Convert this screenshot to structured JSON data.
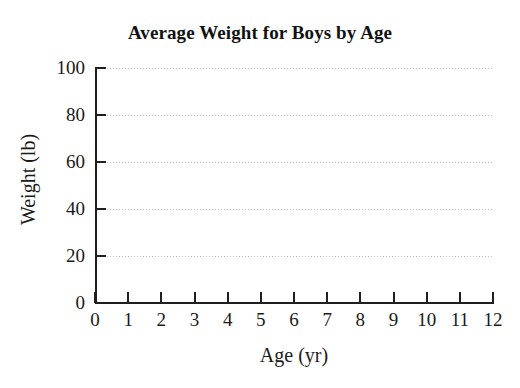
{
  "chart_data": {
    "type": "line",
    "title": "Average Weight for Boys by Age",
    "subtitle": "",
    "xlabel": "Age (yr)",
    "ylabel": "Weight (lb)",
    "x": [],
    "values": [],
    "series": [],
    "xlim": [
      0,
      12
    ],
    "ylim": [
      0,
      100
    ],
    "x_ticks": [
      "0",
      "1",
      "2",
      "3",
      "4",
      "5",
      "6",
      "7",
      "8",
      "9",
      "10",
      "11",
      "12"
    ],
    "y_ticks": [
      "0",
      "20",
      "40",
      "60",
      "80",
      "100"
    ],
    "x_tick_values": [
      0,
      1,
      2,
      3,
      4,
      5,
      6,
      7,
      8,
      9,
      10,
      11,
      12
    ],
    "y_tick_values": [
      0,
      20,
      40,
      60,
      80,
      100
    ],
    "gridlines": {
      "horizontal": true,
      "horizontal_at": [
        20,
        40,
        60,
        80,
        100
      ],
      "vertical": false,
      "style": "dotted"
    },
    "legend": null,
    "annotations": []
  },
  "colors": {
    "background": "#ffffff",
    "axis": "#1f1f1f",
    "text": "#1a1a1a",
    "title": "#121212",
    "gridline": "#b8b8b8"
  }
}
